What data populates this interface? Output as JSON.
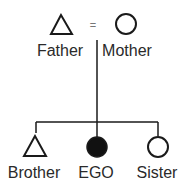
{
  "diagram": {
    "type": "kinship",
    "colors": {
      "stroke": "#1a1a1a",
      "ego_fill": "#111111",
      "text": "#2a2a2a"
    },
    "parents": {
      "marriage_symbol": "=",
      "father": {
        "label": "Father",
        "symbol": "triangle"
      },
      "mother": {
        "label": "Mother",
        "symbol": "circle"
      }
    },
    "children": [
      {
        "label": "Brother",
        "symbol": "triangle",
        "filled": false
      },
      {
        "label": "EGO",
        "symbol": "circle",
        "filled": true
      },
      {
        "label": "Sister",
        "symbol": "circle",
        "filled": false
      }
    ]
  }
}
